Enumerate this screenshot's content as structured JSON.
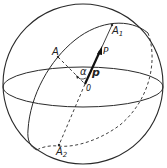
{
  "diagram": {
    "colors": {
      "stroke": "#2a2a2a",
      "background": "#ffffff"
    },
    "labels": {
      "A": "A",
      "A1_base": "A",
      "A1_sub": "1",
      "A2_base": "A",
      "A2_sub": "2",
      "P": "P",
      "p": "p",
      "alpha": "α",
      "O": "0"
    },
    "elements": [
      {
        "name": "sphere-outline",
        "type": "circle"
      },
      {
        "name": "equator",
        "type": "ellipse"
      },
      {
        "name": "great-circle",
        "type": "tilted-ellipse",
        "through": [
          "A",
          "A1",
          "A2"
        ]
      },
      {
        "name": "axis-A1-A2",
        "type": "line",
        "through": [
          "A1",
          "O",
          "A2"
        ]
      },
      {
        "name": "radius-A-O",
        "type": "dashed-line"
      },
      {
        "name": "vector-p",
        "type": "bold-arrow",
        "from": "O",
        "toward": "A1"
      },
      {
        "name": "angle-alpha",
        "type": "arc",
        "between": [
          "OA",
          "p"
        ]
      }
    ]
  }
}
